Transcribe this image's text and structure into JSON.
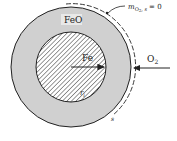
{
  "diagram": {
    "title": "",
    "outer_layer_label": "FeO",
    "core_label": "Fe",
    "surface_condition": {
      "symbol": "m",
      "subscript": "O",
      "subscript2": "2",
      "subscript3": ", s",
      "rhs": "= 0"
    },
    "incoming_species": {
      "label": "O",
      "sub": "2"
    },
    "inner_radius_label": "r",
    "inner_radius_sub": "i",
    "surface_label": "s",
    "colors": {
      "oxide_fill": "#d0d0d0",
      "core_fill": "#ffffff",
      "hatch": "#333333",
      "stroke": "#222222"
    }
  }
}
